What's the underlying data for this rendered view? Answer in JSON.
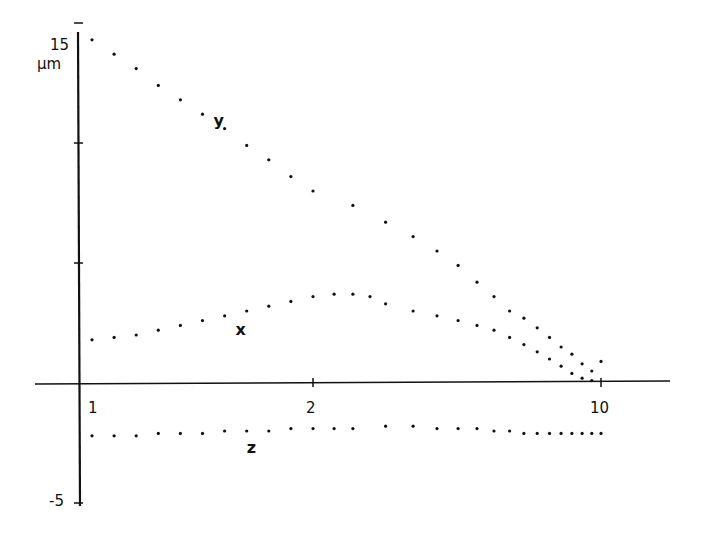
{
  "chart_data": {
    "type": "scatter",
    "title": "",
    "xlabel": "",
    "ylabel": "µm",
    "ylim": [
      -5,
      15
    ],
    "y_ticks": [
      -5,
      0,
      5,
      10,
      15
    ],
    "y_tick_labels_shown": {
      "15": "15",
      "-5": "-5"
    },
    "x_ticks": [
      1,
      2,
      10
    ],
    "x_tick_labels": [
      "1",
      "2",
      "10"
    ],
    "grid": false,
    "legend": "inline labels",
    "series": [
      {
        "name": "y",
        "label_pos": {
          "x": 1.55,
          "y": 10.7
        },
        "x": [
          1.0,
          1.1,
          1.2,
          1.3,
          1.4,
          1.5,
          1.6,
          1.7,
          1.8,
          1.9,
          2.0,
          2.5,
          3.0,
          3.5,
          4.0,
          4.5,
          5.0,
          5.5,
          6.0,
          6.5,
          7.0,
          7.5,
          8.0,
          8.5,
          9.0,
          9.5,
          10.0
        ],
        "values": [
          14.3,
          13.7,
          13.1,
          12.4,
          11.8,
          11.2,
          10.6,
          9.9,
          9.3,
          8.6,
          8.0,
          7.4,
          6.7,
          6.1,
          5.5,
          4.9,
          4.2,
          3.6,
          3.0,
          2.7,
          2.3,
          1.9,
          1.5,
          1.2,
          0.8,
          0.5,
          0.9
        ]
      },
      {
        "name": "x",
        "label_pos": {
          "x": 1.65,
          "y": 2.0
        },
        "x": [
          1.0,
          1.1,
          1.2,
          1.3,
          1.4,
          1.5,
          1.6,
          1.7,
          1.8,
          1.9,
          2.0,
          2.25,
          2.5,
          2.75,
          3.0,
          3.5,
          4.0,
          4.5,
          5.0,
          5.5,
          6.0,
          6.5,
          7.0,
          7.5,
          8.0,
          8.5,
          9.0,
          9.5
        ],
        "values": [
          1.8,
          1.9,
          2.0,
          2.2,
          2.4,
          2.6,
          2.8,
          3.0,
          3.2,
          3.4,
          3.6,
          3.7,
          3.7,
          3.6,
          3.3,
          3.0,
          2.8,
          2.6,
          2.4,
          2.2,
          1.9,
          1.6,
          1.3,
          1.0,
          0.7,
          0.4,
          0.2,
          0.1
        ]
      },
      {
        "name": "z",
        "label_pos": {
          "x": 1.7,
          "y": -2.9
        },
        "x": [
          1.0,
          1.1,
          1.2,
          1.3,
          1.4,
          1.5,
          1.6,
          1.7,
          1.8,
          1.9,
          2.0,
          2.25,
          2.5,
          3.0,
          3.5,
          4.0,
          4.5,
          5.0,
          5.5,
          6.0,
          6.5,
          7.0,
          7.5,
          8.0,
          8.5,
          9.0,
          9.5,
          10.0
        ],
        "values": [
          -2.2,
          -2.2,
          -2.2,
          -2.1,
          -2.1,
          -2.1,
          -2.0,
          -2.0,
          -2.0,
          -1.9,
          -1.9,
          -1.9,
          -1.9,
          -1.8,
          -1.8,
          -1.9,
          -1.9,
          -1.9,
          -2.0,
          -2.0,
          -2.1,
          -2.1,
          -2.1,
          -2.1,
          -2.1,
          -2.1,
          -2.1,
          -2.1
        ]
      }
    ]
  },
  "axes": {
    "y_unit": "µm",
    "y_top_label": "15",
    "y_bottom_label": "-5",
    "x_labels": [
      "1",
      "2",
      "10"
    ]
  }
}
